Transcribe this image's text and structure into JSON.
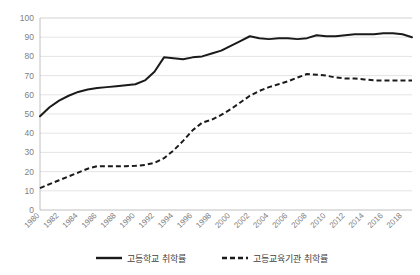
{
  "chart_data": {
    "type": "line",
    "title": "",
    "subtitle": "",
    "xlabel": "",
    "ylabel": "",
    "ylim": [
      0,
      100
    ],
    "ytick_labels": [
      "0",
      "10",
      "20",
      "30",
      "40",
      "50",
      "60",
      "70",
      "80",
      "90",
      "100"
    ],
    "ytick_values": [
      0,
      10,
      20,
      30,
      40,
      50,
      60,
      70,
      80,
      90,
      100
    ],
    "grid": true,
    "grid_axis": "y",
    "legend_position": "bottom",
    "x": [
      1980,
      1981,
      1982,
      1983,
      1984,
      1985,
      1986,
      1987,
      1988,
      1989,
      1990,
      1991,
      1992,
      1993,
      1994,
      1995,
      1996,
      1997,
      1998,
      1999,
      2000,
      2001,
      2002,
      2003,
      2004,
      2005,
      2006,
      2007,
      2008,
      2009,
      2010,
      2011,
      2012,
      2013,
      2014,
      2015,
      2016,
      2017,
      2018,
      2019
    ],
    "xtick_labels": [
      "1980",
      "1982",
      "1984",
      "1986",
      "1988",
      "1990",
      "1992",
      "1994",
      "1996",
      "1998",
      "2000",
      "2002",
      "2004",
      "2006",
      "2008",
      "2010",
      "2012",
      "2014",
      "2016",
      "2018"
    ],
    "xtick_values": [
      1980,
      1982,
      1984,
      1986,
      1988,
      1990,
      1992,
      1994,
      1996,
      1998,
      2000,
      2002,
      2004,
      2006,
      2008,
      2010,
      2012,
      2014,
      2016,
      2018
    ],
    "series": [
      {
        "name": "고등학교 취학률",
        "style": "solid",
        "color": "#1a1a1a",
        "values": [
          48.8,
          53.5,
          57.0,
          59.5,
          61.5,
          62.8,
          63.5,
          64.0,
          64.5,
          65.0,
          65.5,
          67.5,
          72.0,
          79.5,
          79.0,
          78.5,
          79.5,
          80.0,
          81.5,
          83.0,
          85.5,
          88.0,
          90.5,
          89.5,
          89.0,
          89.5,
          89.5,
          89.0,
          89.5,
          91.0,
          90.5,
          90.5,
          91.0,
          91.5,
          91.5,
          91.5,
          92.0,
          92.0,
          91.5,
          90.0
        ]
      },
      {
        "name": "고등교육기관 취학률",
        "style": "dashed",
        "color": "#1a1a1a",
        "values": [
          11.4,
          13.5,
          15.5,
          17.5,
          19.5,
          21.5,
          22.8,
          22.8,
          22.8,
          22.8,
          23.0,
          23.5,
          24.5,
          27.0,
          31.0,
          36.0,
          41.5,
          45.5,
          47.0,
          49.5,
          52.5,
          56.0,
          59.5,
          62.0,
          64.0,
          65.5,
          67.0,
          69.0,
          70.8,
          70.5,
          70.0,
          69.0,
          68.5,
          68.5,
          68.0,
          67.5,
          67.5,
          67.5,
          67.5,
          67.5
        ]
      }
    ],
    "legend": [
      {
        "label": "고등학교 취학률",
        "style": "solid",
        "color": "#1a1a1a"
      },
      {
        "label": "고등교육기관 취학률",
        "style": "dashed",
        "color": "#1a1a1a"
      }
    ],
    "colors": {
      "series": "#1a1a1a",
      "grid": "#d9d9d9",
      "tick_text": "#7f7f7f",
      "legend_text": "#404040",
      "background": "#ffffff"
    }
  }
}
